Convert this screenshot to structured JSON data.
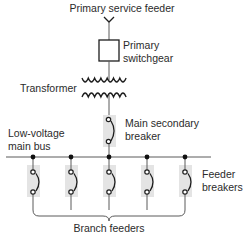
{
  "diagram": {
    "labels": {
      "primary_service_feeder": "Primary service feeder",
      "primary_switchgear_line1": "Primary",
      "primary_switchgear_line2": "switchgear",
      "transformer": "Transformer",
      "main_secondary_breaker_line1": "Main secondary",
      "main_secondary_breaker_line2": "breaker",
      "low_voltage_bus_line1": "Low-voltage",
      "low_voltage_bus_line2": "main bus",
      "feeder_breakers_line1": "Feeder",
      "feeder_breakers_line2": "breakers",
      "branch_feeders": "Branch feeders"
    },
    "components": [
      {
        "id": "primary-service-feeder",
        "type": "incoming-feeder"
      },
      {
        "id": "primary-switchgear",
        "type": "switchgear"
      },
      {
        "id": "transformer",
        "type": "transformer"
      },
      {
        "id": "main-secondary-breaker",
        "type": "circuit-breaker"
      },
      {
        "id": "low-voltage-main-bus",
        "type": "bus"
      },
      {
        "id": "feeder-breakers",
        "type": "circuit-breaker",
        "count": 5
      },
      {
        "id": "branch-feeders",
        "type": "feeder-group",
        "count": 5
      }
    ],
    "connections": [
      [
        "primary-service-feeder",
        "primary-switchgear"
      ],
      [
        "primary-switchgear",
        "transformer"
      ],
      [
        "transformer",
        "main-secondary-breaker"
      ],
      [
        "main-secondary-breaker",
        "low-voltage-main-bus"
      ],
      [
        "low-voltage-main-bus",
        "feeder-breakers"
      ],
      [
        "feeder-breakers",
        "branch-feeders"
      ]
    ],
    "colors": {
      "line": "#5a5a5a",
      "symbol": "#1e1e1e",
      "breaker_shade": "#e4e4e4",
      "text": "#2b2b2b"
    }
  }
}
